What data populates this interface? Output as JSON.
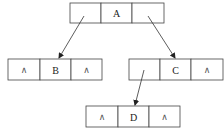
{
  "diagram": {
    "type": "binary-tree-linked-representation",
    "nodes": [
      {
        "id": "A",
        "label": "A",
        "left": "pointer",
        "right": "pointer",
        "x": 70,
        "y": 3,
        "w": 94,
        "h": 20
      },
      {
        "id": "B",
        "label": "B",
        "left": "∧",
        "right": "∧",
        "x": 8,
        "y": 59,
        "w": 94,
        "h": 21
      },
      {
        "id": "C",
        "label": "C",
        "left": "pointer",
        "right": "∧",
        "x": 129,
        "y": 59,
        "w": 94,
        "h": 21
      },
      {
        "id": "D",
        "label": "D",
        "left": "∧",
        "right": "∧",
        "x": 86,
        "y": 106,
        "w": 94,
        "h": 21
      }
    ],
    "edges": [
      {
        "from": "A.left",
        "to": "B",
        "x1": 84,
        "y1": 16,
        "x2": 59,
        "y2": 58
      },
      {
        "from": "A.right",
        "to": "C",
        "x1": 148,
        "y1": 16,
        "x2": 175,
        "y2": 58
      },
      {
        "from": "C.left",
        "to": "D",
        "x1": 144,
        "y1": 70,
        "x2": 135,
        "y2": 105
      }
    ],
    "null_symbol": "∧"
  }
}
